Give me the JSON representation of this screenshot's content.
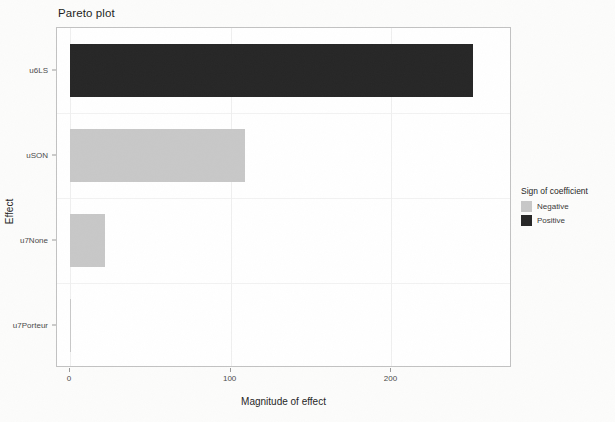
{
  "chart_data": {
    "type": "bar",
    "orientation": "horizontal",
    "title": "Pareto plot",
    "xlabel": "Magnitude of effect",
    "ylabel": "Effect",
    "categories": [
      "u6LS",
      "uSON",
      "u7None",
      "u7Porteur"
    ],
    "values": [
      251,
      109,
      22,
      1
    ],
    "series": [
      {
        "name": "Magnitude of effect",
        "values": [
          251,
          109,
          22,
          1
        ],
        "signs": [
          "Positive",
          "Negative",
          "Negative",
          "Negative"
        ]
      }
    ],
    "xlim": [
      -8,
      275
    ],
    "xticks": [
      0,
      100,
      200
    ],
    "xticklabels": [
      "0",
      "100",
      "200"
    ],
    "grid": true,
    "legend": {
      "title": "Sign of coefficient",
      "position": "right",
      "entries": [
        {
          "label": "Negative",
          "color": "#c8c8c8"
        },
        {
          "label": "Positive",
          "color": "#262626"
        }
      ]
    },
    "colors": {
      "negative": "#c8c8c8",
      "positive": "#262626",
      "panel_background": "#ffffff",
      "panel_border": "#c2c2c2",
      "gridline": "#efefef",
      "page_background": "#fcfcfb"
    }
  },
  "axes": {
    "y_tick_labels": [
      "u6LS",
      "uSON",
      "u7None",
      "u7Porteur"
    ],
    "x_tick_labels": [
      "0",
      "100",
      "200"
    ]
  }
}
